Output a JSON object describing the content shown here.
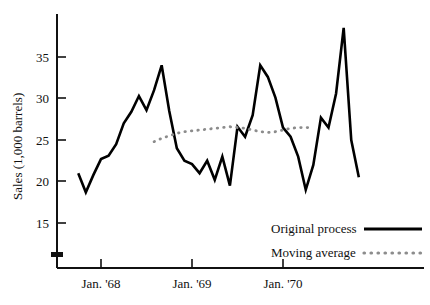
{
  "chart_data": {
    "type": "line",
    "title": "",
    "xlabel": "",
    "ylabel": "Sales (1,000 barrels)",
    "ylim": [
      12,
      40
    ],
    "xlim": [
      0,
      48
    ],
    "grid": false,
    "legend_position": "bottom-right",
    "yticks": [
      15,
      20,
      25,
      30,
      35
    ],
    "ytick_labels": [
      "15",
      "20",
      "25",
      "30",
      "35"
    ],
    "y_axis_break": true,
    "xticks": [
      6,
      18,
      30
    ],
    "xtick_labels": [
      "Jan. '68",
      "Jan. '69",
      "Jan. '70"
    ],
    "series": [
      {
        "name": "Original process",
        "style": "solid",
        "color": "#000000",
        "x": [
          3,
          4,
          5,
          6,
          7,
          8,
          9,
          10,
          11,
          12,
          13,
          14,
          15,
          16,
          17,
          18,
          19,
          20,
          21,
          22,
          23,
          24,
          25,
          26,
          27,
          28,
          29,
          30,
          31,
          32,
          33,
          34,
          35,
          36,
          37,
          38,
          39,
          40
        ],
        "values": [
          21.0,
          18.7,
          20.8,
          22.7,
          23.1,
          24.5,
          27.0,
          28.4,
          30.3,
          28.6,
          31.0,
          34.0,
          28.5,
          24.0,
          22.5,
          22.1,
          21.0,
          22.5,
          20.2,
          23.0,
          19.5,
          26.6,
          25.4,
          28.0,
          34.0,
          32.6,
          30.1,
          26.5,
          25.4,
          23.0,
          19.0,
          22.0,
          27.7,
          26.5,
          30.6,
          38.5,
          25.0,
          20.5
        ]
      },
      {
        "name": "Moving average",
        "style": "dotted",
        "color": "#8c8c8c",
        "x": [
          13,
          14,
          15,
          16,
          17,
          18,
          19,
          20,
          21,
          22,
          23,
          24,
          25,
          26,
          27,
          28,
          29,
          30,
          31,
          32,
          33,
          34
        ],
        "values": [
          24.8,
          25.2,
          25.5,
          25.8,
          26.0,
          26.1,
          26.2,
          26.3,
          26.4,
          26.5,
          26.6,
          26.5,
          26.4,
          26.2,
          26.0,
          25.9,
          26.0,
          26.2,
          26.4,
          26.5,
          26.5,
          26.5
        ]
      }
    ]
  },
  "axis": {
    "y_label": "Sales (1,000 barrels)"
  },
  "legend": {
    "entries": [
      {
        "label": "Original process",
        "style": "solid"
      },
      {
        "label": "Moving average",
        "style": "dotted"
      }
    ]
  }
}
